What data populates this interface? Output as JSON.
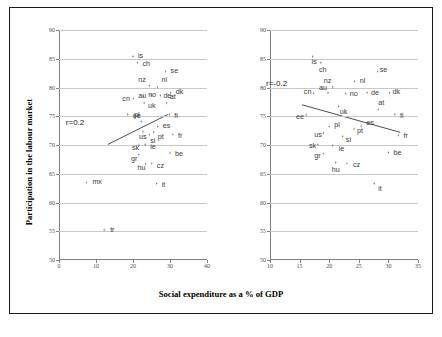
{
  "figure": {
    "xlabel": "Social expenditure as a % of GDP",
    "ylabel": "Participation in the labour market"
  },
  "chart_data": [
    {
      "type": "scatter",
      "panel": "left",
      "title": "",
      "xlabel": "Social expenditure as a % of GDP",
      "ylabel": "Participation in the labour market",
      "xlim": [
        0,
        40
      ],
      "ylim": [
        50,
        90
      ],
      "xticks": [
        0,
        10,
        20,
        30,
        40
      ],
      "yticks": [
        50,
        55,
        60,
        65,
        70,
        75,
        80,
        85,
        90
      ],
      "grid": "horizontal",
      "annotation": "r=0.2",
      "trendline": {
        "x0": 13.2,
        "y0": 70.1,
        "x1": 29.4,
        "y1": 75.3
      },
      "points": [
        {
          "label": "is",
          "x": 20.0,
          "y": 85.4
        },
        {
          "label": "ch",
          "x": 21.2,
          "y": 84.3
        },
        {
          "label": "se",
          "x": 28.8,
          "y": 82.8
        },
        {
          "label": "nl",
          "x": 26.6,
          "y": 80.1
        },
        {
          "label": "nz",
          "x": 24.4,
          "y": 80.3
        },
        {
          "label": "dk",
          "x": 30.2,
          "y": 79.1
        },
        {
          "label": "de",
          "x": 27.4,
          "y": 78.6
        },
        {
          "label": "no",
          "x": 24.9,
          "y": 78.7
        },
        {
          "label": "au",
          "x": 22.8,
          "y": 78.5
        },
        {
          "label": "cn",
          "x": 20.1,
          "y": 78.1
        },
        {
          "label": "at",
          "x": 29.1,
          "y": 77.3
        },
        {
          "label": "uk",
          "x": 23.0,
          "y": 77.3
        },
        {
          "label": "ee",
          "x": 18.6,
          "y": 75.3
        },
        {
          "label": "fi",
          "x": 29.8,
          "y": 75.3
        },
        {
          "label": "pl",
          "x": 22.2,
          "y": 74.1
        },
        {
          "label": "es",
          "x": 26.7,
          "y": 73.2
        },
        {
          "label": "us",
          "x": 22.7,
          "y": 72.3
        },
        {
          "label": "pt",
          "x": 25.6,
          "y": 72.2
        },
        {
          "label": "si",
          "x": 24.4,
          "y": 71.8
        },
        {
          "label": "fr",
          "x": 30.8,
          "y": 71.8
        },
        {
          "label": "ie",
          "x": 23.3,
          "y": 70.1
        },
        {
          "label": "sk",
          "x": 21.6,
          "y": 70.0
        },
        {
          "label": "be",
          "x": 30.0,
          "y": 68.6
        },
        {
          "label": "gr",
          "x": 21.6,
          "y": 68.3
        },
        {
          "label": "hu",
          "x": 23.4,
          "y": 66.7
        },
        {
          "label": "cz",
          "x": 25.1,
          "y": 66.8
        },
        {
          "label": "mx",
          "x": 7.4,
          "y": 63.5
        },
        {
          "label": "it",
          "x": 26.4,
          "y": 63.3
        },
        {
          "label": "tr",
          "x": 12.2,
          "y": 55.2
        }
      ]
    },
    {
      "type": "scatter",
      "panel": "right",
      "title": "",
      "xlabel": "Social expenditure as a % of GDP",
      "ylabel": "Participation in the labour market",
      "xlim": [
        10,
        35
      ],
      "ylim": [
        50,
        90
      ],
      "xticks": [
        10,
        15,
        20,
        25,
        30,
        35
      ],
      "yticks": [
        50,
        55,
        60,
        65,
        70,
        75,
        80,
        85,
        90
      ],
      "grid": "horizontal",
      "annotation": "r=-0.2",
      "trendline": {
        "x0": 15.4,
        "y0": 77.0,
        "x1": 32.0,
        "y1": 72.2
      },
      "points": [
        {
          "label": "is",
          "x": 17.2,
          "y": 85.4
        },
        {
          "label": "ch",
          "x": 18.6,
          "y": 84.3
        },
        {
          "label": "se",
          "x": 28.2,
          "y": 82.8
        },
        {
          "label": "nl",
          "x": 24.3,
          "y": 81.1
        },
        {
          "label": "nz",
          "x": 20.6,
          "y": 80.1
        },
        {
          "label": "dk",
          "x": 30.2,
          "y": 79.1
        },
        {
          "label": "de",
          "x": 26.4,
          "y": 79.1
        },
        {
          "label": "no",
          "x": 22.8,
          "y": 78.9
        },
        {
          "label": "au",
          "x": 19.8,
          "y": 79.1
        },
        {
          "label": "cn",
          "x": 17.4,
          "y": 79.0
        },
        {
          "label": "at",
          "x": 28.3,
          "y": 76.2
        },
        {
          "label": "uk",
          "x": 21.6,
          "y": 76.7
        },
        {
          "label": "ee",
          "x": 16.1,
          "y": 75.2
        },
        {
          "label": "fi",
          "x": 31.1,
          "y": 75.3
        },
        {
          "label": "pl",
          "x": 20.0,
          "y": 73.2
        },
        {
          "label": "es",
          "x": 25.4,
          "y": 73.3
        },
        {
          "label": "us",
          "x": 19.0,
          "y": 72.1
        },
        {
          "label": "pt",
          "x": 24.2,
          "y": 72.8
        },
        {
          "label": "si",
          "x": 22.3,
          "y": 71.5
        },
        {
          "label": "fr",
          "x": 31.7,
          "y": 71.7
        },
        {
          "label": "ie",
          "x": 20.6,
          "y": 69.9
        },
        {
          "label": "sk",
          "x": 18.1,
          "y": 70.1
        },
        {
          "label": "be",
          "x": 30.0,
          "y": 68.7
        },
        {
          "label": "gr",
          "x": 19.0,
          "y": 68.5
        },
        {
          "label": "hu",
          "x": 21.1,
          "y": 66.9
        },
        {
          "label": "cz",
          "x": 23.0,
          "y": 66.8
        },
        {
          "label": "it",
          "x": 27.6,
          "y": 63.3
        }
      ]
    }
  ]
}
